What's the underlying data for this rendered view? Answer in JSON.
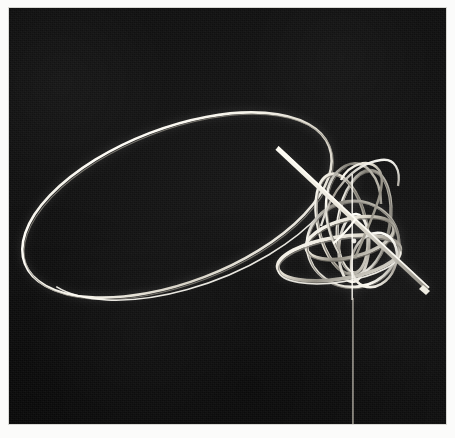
{
  "image": {
    "kind": "photograph",
    "title": "Armillary ring sculpture on a slender vertical stand",
    "medium": "black-and-white photographic print",
    "orientation": "landscape",
    "border_color": "#fbfbfa",
    "background_color": "#0c0c0c",
    "highlight_color": "#f2efe6",
    "mid_tone_color": "#9a968c",
    "frame": {
      "x": 9,
      "y": 8,
      "width": 437,
      "height": 416
    }
  },
  "subject": {
    "name": "Ring sculpture",
    "description": "A cluster of intersecting metal rings forming a sphere, encircled by one very large tilted elliptical ring, supported by a thin vertical rod and pierced by a straight diagonal rod.",
    "elements": [
      {
        "id": "large-orbit-ring",
        "label": "Large elliptical orbit ring"
      },
      {
        "id": "sphere-cluster",
        "label": "Intersecting ring sphere"
      },
      {
        "id": "equator-ring",
        "label": "Wide equatorial ring"
      },
      {
        "id": "meridian-ring",
        "label": "Tall meridian ring"
      },
      {
        "id": "diagonal-axis-rod",
        "label": "Diagonal axis rod"
      },
      {
        "id": "vertical-axis-rod",
        "label": "Vertical axis rod"
      },
      {
        "id": "support-stem",
        "label": "Thin support stem"
      }
    ]
  },
  "geometry": {
    "large_ring": {
      "cx": 168,
      "cy": 197,
      "rx": 163,
      "ry": 77,
      "rotate": -21,
      "stroke": 2.2
    },
    "sphere": {
      "cx": 347,
      "cy": 233,
      "r": 55
    },
    "stem": {
      "x": 344,
      "y1": 292,
      "y2": 416,
      "width": 1.2
    },
    "diagonal_rod": {
      "x1": 268,
      "y1": 140,
      "x2": 419,
      "y2": 281,
      "width": 5
    }
  },
  "a11y": {
    "alt": "Black and white photograph of a wire sculpture: a large thin elliptical ring sweeps from the upper left down to the lower right, where it meets a dense cluster of intersecting circular bands forming a sphere mounted on a slim vertical rod."
  }
}
